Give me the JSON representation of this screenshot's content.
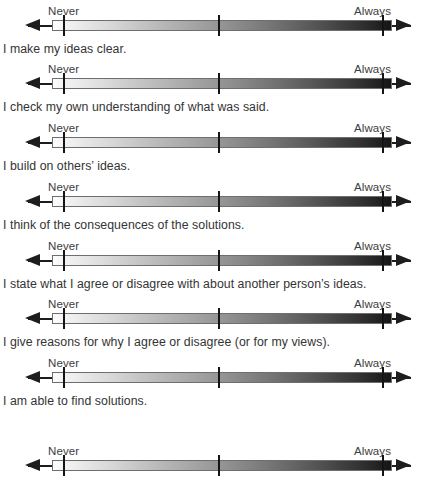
{
  "scale": {
    "left_anchor": "Never",
    "right_anchor": "Always",
    "tick_count": 3,
    "gradient_from": "#fdfdfd",
    "gradient_to": "#151515",
    "axis_color": "#1d1d1d",
    "text_color": "#343434"
  },
  "items": [
    {
      "statement": "I make my ideas clear.",
      "never": "Never",
      "always": "Always"
    },
    {
      "statement": "I check my own understanding of what was said.",
      "never": "Never",
      "always": "Always"
    },
    {
      "statement": "I build on others’ ideas.",
      "never": "Never",
      "always": "Always"
    },
    {
      "statement": "I think of the consequences of the solutions.",
      "never": "Never",
      "always": "Always"
    },
    {
      "statement": "I state what I agree or disagree with about another person’s ideas.",
      "never": "Never",
      "always": "Always"
    },
    {
      "statement": "I give reasons for why I agree or disagree (or for my views).",
      "never": "Never",
      "always": "Always"
    },
    {
      "statement": "I am able to find solutions.",
      "never": "Never",
      "always": "Always"
    },
    {
      "statement": "",
      "never": "Never",
      "always": "Always"
    }
  ]
}
